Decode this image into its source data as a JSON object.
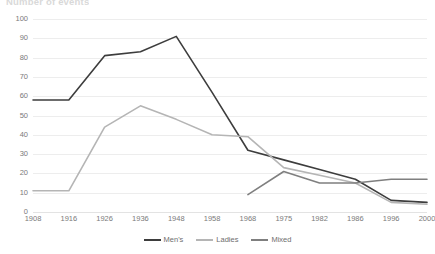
{
  "chart_data": {
    "type": "line",
    "title": "Number of events",
    "xlabel": "",
    "ylabel": "",
    "ylim": [
      0,
      100
    ],
    "ytick_step": 10,
    "yticks": [
      "0",
      "10",
      "20",
      "30",
      "40",
      "50",
      "60",
      "70",
      "80",
      "90",
      "100"
    ],
    "grid": true,
    "legend_position": "bottom",
    "categories": [
      "1908",
      "1916",
      "1926",
      "1936",
      "1948",
      "1958",
      "1968",
      "1975",
      "1982",
      "1986",
      "1996",
      "2000"
    ],
    "series": [
      {
        "name": "Men's",
        "color": "#3d3d3d",
        "values": [
          58,
          58,
          81,
          83,
          91,
          62,
          32,
          27,
          22,
          17,
          6,
          5
        ]
      },
      {
        "name": "Ladies",
        "color": "#b5b5b5",
        "values": [
          11,
          11,
          44,
          55,
          48,
          40,
          39,
          23,
          19,
          15,
          5,
          4
        ]
      },
      {
        "name": "Mixed",
        "color": "#7f7f7f",
        "values": [
          null,
          null,
          null,
          null,
          null,
          null,
          9,
          21,
          15,
          15,
          17,
          17
        ]
      }
    ]
  },
  "colors": {
    "gridline": "#ededed",
    "axis_text": "#7a7a7a",
    "background": "#ffffff"
  }
}
